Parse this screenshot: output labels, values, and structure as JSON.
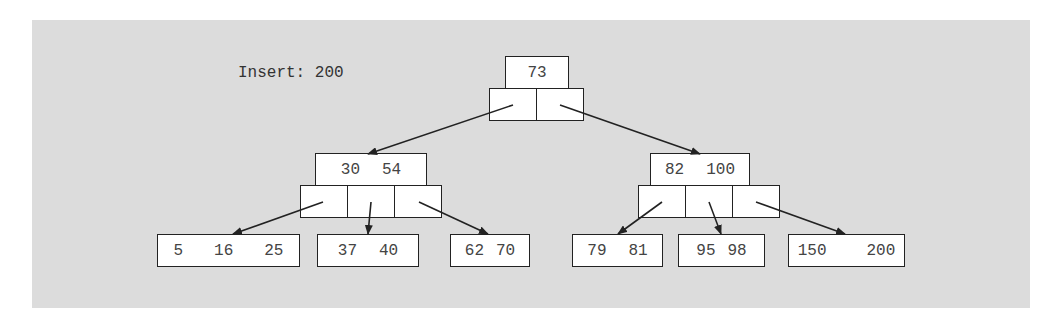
{
  "caption": "Insert: 200",
  "tree": {
    "root": {
      "keys": [
        "73"
      ]
    },
    "level1": [
      {
        "keys": [
          "30",
          "54"
        ]
      },
      {
        "keys": [
          "82",
          "100"
        ]
      }
    ],
    "leaves": [
      {
        "keys": [
          "5",
          "16",
          "25"
        ]
      },
      {
        "keys": [
          "37",
          "40"
        ]
      },
      {
        "keys": [
          "62",
          "70"
        ]
      },
      {
        "keys": [
          "79",
          "81"
        ]
      },
      {
        "keys": [
          "95",
          "98"
        ]
      },
      {
        "keys": [
          "150",
          "200"
        ]
      }
    ]
  }
}
